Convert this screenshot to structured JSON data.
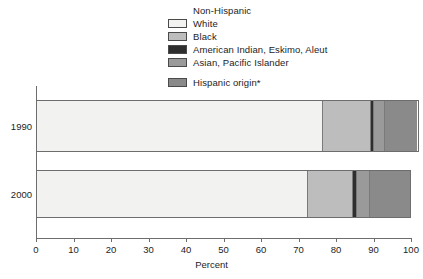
{
  "legend": {
    "entries": [
      {
        "label": "Non-Hispanic",
        "color": null,
        "swatch": false
      },
      {
        "label": "White",
        "color": "#f2f2f0",
        "swatch": true
      },
      {
        "label": "Black",
        "color": "#bdbdbd",
        "swatch": true
      },
      {
        "label": "American Indian, Eskimo, Aleut",
        "color": "#2e2e2e",
        "swatch": true
      },
      {
        "label": "Asian, Pacific Islander",
        "color": "#9a9a9a",
        "swatch": true
      },
      {
        "label": "Hispanic origin*",
        "color": "#8a8a8a",
        "swatch": true
      }
    ]
  },
  "axis": {
    "xlabel": "Percent",
    "xticks": [
      "0",
      "10",
      "20",
      "30",
      "40",
      "50",
      "60",
      "70",
      "80",
      "90",
      "100"
    ],
    "ycategories": [
      "1990",
      "2000"
    ]
  },
  "chart_data": {
    "type": "bar",
    "orientation": "horizontal",
    "stacked": true,
    "title": "",
    "xlabel": "Percent",
    "ylabel": "",
    "xlim": [
      0,
      100
    ],
    "grid": false,
    "legend_position": "top",
    "categories": [
      "1990",
      "2000"
    ],
    "series": [
      {
        "name": "White",
        "color": "#f2f2f0",
        "values": [
          76.5,
          72.3
        ]
      },
      {
        "name": "Black",
        "color": "#bdbdbd",
        "values": [
          12.8,
          12.2
        ]
      },
      {
        "name": "American Indian, Eskimo, Aleut",
        "color": "#2e2e2e",
        "values": [
          0.8,
          0.9
        ]
      },
      {
        "name": "Asian, Pacific Islander",
        "color": "#9a9a9a",
        "values": [
          2.9,
          3.6
        ]
      },
      {
        "name": "Hispanic origin*",
        "color": "#8a8a8a",
        "values": [
          9.0,
          11.0
        ]
      }
    ],
    "footnote": "*"
  }
}
